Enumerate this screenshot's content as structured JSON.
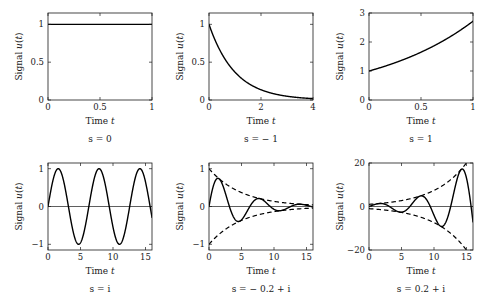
{
  "figure": {
    "axis_label_x": "Time t",
    "axis_label_y": "Signal u(t)",
    "background": "#ffffff",
    "curve_color": "#000000",
    "frame_color": "#1a1a1a"
  },
  "chart_data": [
    {
      "type": "line",
      "id": "panel-s-0",
      "title": "",
      "caption": "s = 0",
      "s_value": "0",
      "function": "u(t) = exp(0*t) = 1",
      "xlabel": "Time t",
      "ylabel": "Signal u(t)",
      "xlim": [
        0,
        1
      ],
      "ylim": [
        0,
        1.15
      ],
      "xticks": [
        0,
        0.5,
        1
      ],
      "xticklabels": [
        "0",
        "0.5",
        "1"
      ],
      "yticks": [
        0,
        0.5,
        1
      ],
      "yticklabels": [
        "0",
        "0.5",
        "1"
      ],
      "grid": false,
      "legend": "none",
      "series": [
        {
          "name": "u(t)",
          "style": "solid",
          "x": [
            0,
            0.1,
            0.2,
            0.3,
            0.4,
            0.5,
            0.6,
            0.7,
            0.8,
            0.9,
            1
          ],
          "values": [
            1,
            1,
            1,
            1,
            1,
            1,
            1,
            1,
            1,
            1,
            1
          ]
        }
      ]
    },
    {
      "type": "line",
      "id": "panel-s-neg1",
      "title": "",
      "caption": "s = − 1",
      "s_value": "-1",
      "function": "u(t) = exp(-t)",
      "xlabel": "Time t",
      "ylabel": "Signal u(t)",
      "xlim": [
        0,
        4
      ],
      "ylim": [
        0,
        1.15
      ],
      "xticks": [
        0,
        2,
        4
      ],
      "xticklabels": [
        "0",
        "2",
        "4"
      ],
      "yticks": [
        0,
        0.5,
        1
      ],
      "yticklabels": [
        "0",
        "0.5",
        "1"
      ],
      "grid": false,
      "legend": "none",
      "series": [
        {
          "name": "u(t)",
          "style": "solid",
          "x": [
            0,
            0.25,
            0.5,
            0.75,
            1,
            1.25,
            1.5,
            1.75,
            2,
            2.25,
            2.5,
            2.75,
            3,
            3.25,
            3.5,
            3.75,
            4
          ],
          "values": [
            1,
            0.779,
            0.607,
            0.472,
            0.368,
            0.287,
            0.223,
            0.174,
            0.135,
            0.105,
            0.082,
            0.064,
            0.05,
            0.039,
            0.03,
            0.024,
            0.018
          ]
        }
      ]
    },
    {
      "type": "line",
      "id": "panel-s-1",
      "title": "",
      "caption": "s = 1",
      "s_value": "1",
      "function": "u(t) = exp(t)",
      "xlabel": "Time t",
      "ylabel": "Signal u(t)",
      "xlim": [
        0,
        1
      ],
      "ylim": [
        0,
        3
      ],
      "xticks": [
        0,
        0.5,
        1
      ],
      "xticklabels": [
        "0",
        "0.5",
        "1"
      ],
      "yticks": [
        0,
        1,
        2,
        3
      ],
      "yticklabels": [
        "0",
        "1",
        "2",
        "3"
      ],
      "grid": false,
      "legend": "none",
      "series": [
        {
          "name": "u(t)",
          "style": "solid",
          "x": [
            0,
            0.1,
            0.2,
            0.3,
            0.4,
            0.5,
            0.6,
            0.7,
            0.8,
            0.9,
            1
          ],
          "values": [
            1,
            1.105,
            1.221,
            1.35,
            1.492,
            1.649,
            1.822,
            2.014,
            2.226,
            2.46,
            2.718
          ]
        }
      ]
    },
    {
      "type": "line",
      "id": "panel-s-i",
      "title": "",
      "caption": "s = i",
      "s_value": "i",
      "function": "u(t) = sin(t)",
      "xlabel": "Time t",
      "ylabel": "Signal u(t)",
      "xlim": [
        0,
        16
      ],
      "ylim": [
        -1.15,
        1.15
      ],
      "xticks": [
        0,
        5,
        10,
        15
      ],
      "xticklabels": [
        "0",
        "5",
        "10",
        "15"
      ],
      "yticks": [
        -1,
        0,
        1
      ],
      "yticklabels": [
        "−1",
        "0",
        "1"
      ],
      "grid": false,
      "legend": "none",
      "zero_line": true,
      "series": [
        {
          "name": "u(t)",
          "style": "solid",
          "x": [
            0,
            1,
            2,
            3,
            4,
            5,
            6,
            7,
            8,
            9,
            10,
            11,
            12,
            13,
            14,
            15,
            16
          ],
          "values": [
            0,
            0.841,
            0.909,
            0.141,
            -0.757,
            -0.959,
            -0.279,
            0.657,
            0.989,
            0.412,
            -0.544,
            -1.0,
            -0.537,
            0.42,
            0.991,
            0.65,
            -0.288
          ]
        }
      ]
    },
    {
      "type": "line",
      "id": "panel-s-neg02-i",
      "title": "",
      "caption": "s = − 0.2 + i",
      "s_value": "-0.2+i",
      "function": "u(t) = exp(-0.2t)*sin(t)",
      "xlabel": "Time t",
      "ylabel": "Signal u(t)",
      "xlim": [
        0,
        16
      ],
      "ylim": [
        -1.15,
        1.15
      ],
      "xticks": [
        0,
        5,
        10,
        15
      ],
      "xticklabels": [
        "0",
        "5",
        "10",
        "15"
      ],
      "yticks": [
        -1,
        0,
        1
      ],
      "yticklabels": [
        "−1",
        "0",
        "1"
      ],
      "grid": false,
      "legend": "none",
      "zero_line": true,
      "series": [
        {
          "name": "u(t)",
          "style": "solid",
          "x": [
            0,
            1,
            2,
            3,
            4,
            5,
            6,
            7,
            8,
            9,
            10,
            11,
            12,
            13,
            14,
            15,
            16
          ],
          "values": [
            0,
            0.689,
            0.609,
            0.077,
            -0.34,
            -0.353,
            -0.084,
            0.162,
            0.199,
            0.068,
            -0.074,
            -0.111,
            -0.049,
            0.028,
            0.06,
            0.032,
            -0.012
          ]
        },
        {
          "name": "envelope-upper",
          "style": "dashed",
          "x": [
            0,
            2,
            4,
            6,
            8,
            10,
            12,
            14,
            16
          ],
          "values": [
            1,
            0.67,
            0.449,
            0.301,
            0.202,
            0.135,
            0.091,
            0.061,
            0.041
          ]
        },
        {
          "name": "envelope-lower",
          "style": "dashed",
          "x": [
            0,
            2,
            4,
            6,
            8,
            10,
            12,
            14,
            16
          ],
          "values": [
            -1,
            -0.67,
            -0.449,
            -0.301,
            -0.202,
            -0.135,
            -0.091,
            -0.061,
            -0.041
          ]
        }
      ]
    },
    {
      "type": "line",
      "id": "panel-s-pos02-i",
      "title": "",
      "caption": "s = 0.2 + i",
      "s_value": "0.2+i",
      "function": "u(t) = exp(0.2t)*sin(t)",
      "xlabel": "Time t",
      "ylabel": "Signal u(t)",
      "xlim": [
        0,
        16
      ],
      "ylim": [
        -20,
        20
      ],
      "xticks": [
        0,
        5,
        10,
        15
      ],
      "xticklabels": [
        "0",
        "5",
        "10",
        "15"
      ],
      "yticks": [
        -20,
        0,
        20
      ],
      "yticklabels": [
        "−20",
        "0",
        "20"
      ],
      "grid": false,
      "legend": "none",
      "zero_line": true,
      "series": [
        {
          "name": "u(t)",
          "style": "solid",
          "x": [
            0,
            1,
            2,
            3,
            4,
            5,
            6,
            7,
            8,
            9,
            10,
            11,
            12,
            13,
            14,
            15,
            16
          ],
          "values": [
            0,
            1.027,
            1.356,
            0.257,
            -1.684,
            -2.607,
            -0.927,
            2.665,
            4.897,
            2.491,
            -4.019,
            -9.022,
            -5.34,
            5.651,
            16.31,
            13.06,
            -7.07
          ]
        },
        {
          "name": "envelope-upper",
          "style": "dashed",
          "x": [
            0,
            2,
            4,
            6,
            8,
            10,
            12,
            14,
            16
          ],
          "values": [
            1,
            1.492,
            2.226,
            3.32,
            4.953,
            7.389,
            11.02,
            16.44,
            24.53
          ]
        },
        {
          "name": "envelope-lower",
          "style": "dashed",
          "x": [
            0,
            2,
            4,
            6,
            8,
            10,
            12,
            14,
            16
          ],
          "values": [
            -1,
            -1.492,
            -2.226,
            -3.32,
            -4.953,
            -7.389,
            -11.02,
            -16.44,
            -24.53
          ]
        }
      ]
    }
  ]
}
